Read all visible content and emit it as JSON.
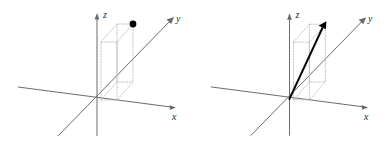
{
  "figure": {
    "background_color": "#ffffff",
    "panel_count": 2
  },
  "style": {
    "axis_color": "#6b6b6b",
    "guide_box_color": "#b9b4a8",
    "point_color": "#000000",
    "vector_color": "#000000",
    "label_color": "#2a2a2a"
  },
  "panels": [
    {
      "id": "point-panel",
      "caption": "",
      "axes": [
        {
          "name": "x",
          "label": "x"
        },
        {
          "name": "y",
          "label": "y"
        },
        {
          "name": "z",
          "label": "z"
        }
      ],
      "marker": {
        "type": "dot",
        "label": ""
      },
      "guide_box": {
        "visible": true,
        "style": "dotted"
      }
    },
    {
      "id": "vector-panel",
      "caption": "",
      "axes": [
        {
          "name": "x",
          "label": "x"
        },
        {
          "name": "y",
          "label": "y"
        },
        {
          "name": "z",
          "label": "z"
        }
      ],
      "marker": {
        "type": "arrow",
        "label": ""
      },
      "guide_box": {
        "visible": true,
        "style": "dotted"
      }
    }
  ],
  "labels": {
    "x": "x",
    "y": "y",
    "z": "z"
  }
}
